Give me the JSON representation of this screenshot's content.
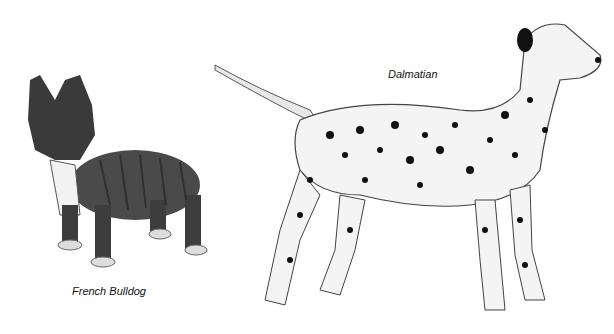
{
  "illustration": {
    "background": "#ffffff",
    "subjects": [
      {
        "name": "French Bulldog",
        "label": "French Bulldog",
        "coat": "brindle",
        "label_position": {
          "x": 72,
          "y": 285
        }
      },
      {
        "name": "Dalmatian",
        "label": "Dalmatian",
        "coat": "white with black spots",
        "label_position": {
          "x": 388,
          "y": 68
        }
      }
    ]
  }
}
